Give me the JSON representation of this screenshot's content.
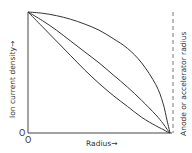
{
  "chart_data": {
    "type": "line",
    "title": "",
    "xlabel": "Radius→",
    "ylabel": "Ion current density→",
    "right_annotation": "Anode or accelerator radius",
    "origin_labels": [
      "O",
      "O"
    ],
    "xlim": [
      0,
      1
    ],
    "ylim": [
      0,
      1
    ],
    "grid": false,
    "legend": null,
    "x": [
      0,
      0.1,
      0.2,
      0.3,
      0.4,
      0.5,
      0.6,
      0.7,
      0.8,
      0.9,
      0.95,
      0.98,
      1.0
    ],
    "series": [
      {
        "name": "flat-profile",
        "values": [
          1.0,
          0.99,
          0.97,
          0.94,
          0.9,
          0.85,
          0.78,
          0.7,
          0.58,
          0.4,
          0.25,
          0.1,
          0.0
        ]
      },
      {
        "name": "linear-profile",
        "values": [
          1.0,
          0.93,
          0.85,
          0.76,
          0.67,
          0.58,
          0.48,
          0.38,
          0.27,
          0.15,
          0.08,
          0.03,
          0.0
        ]
      },
      {
        "name": "peaked-profile",
        "values": [
          1.0,
          0.88,
          0.76,
          0.64,
          0.52,
          0.41,
          0.31,
          0.22,
          0.13,
          0.06,
          0.03,
          0.01,
          0.0
        ]
      }
    ]
  }
}
